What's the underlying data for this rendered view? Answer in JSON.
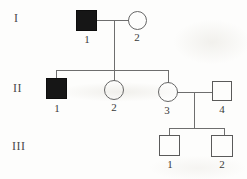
{
  "diagram": {
    "type": "pedigree-chart",
    "generations": [
      {
        "label": "I"
      },
      {
        "label": "II"
      },
      {
        "label": "III"
      }
    ],
    "individuals": [
      {
        "id": "I-1",
        "label": "1",
        "sex": "male",
        "affected": true
      },
      {
        "id": "I-2",
        "label": "2",
        "sex": "female",
        "affected": false
      },
      {
        "id": "II-1",
        "label": "1",
        "sex": "male",
        "affected": true
      },
      {
        "id": "II-2",
        "label": "2",
        "sex": "female",
        "affected": false
      },
      {
        "id": "II-3",
        "label": "3",
        "sex": "female",
        "affected": false
      },
      {
        "id": "II-4",
        "label": "4",
        "sex": "male",
        "affected": false
      },
      {
        "id": "III-1",
        "label": "1",
        "sex": "male",
        "affected": false
      },
      {
        "id": "III-2",
        "label": "2",
        "sex": "male",
        "affected": false
      }
    ],
    "relationships": {
      "couples": [
        "I-1 x I-2",
        "II-3 x II-4"
      ],
      "children_of_I": [
        "II-1",
        "II-2",
        "II-3"
      ],
      "children_of_II3_II4": [
        "III-1",
        "III-2"
      ]
    },
    "colors": {
      "line": "#6e6e6e",
      "shape_stroke": "#5a5a5a",
      "affected_fill": "#161616",
      "label_text": "#3a3a3a",
      "background": "#fdfdfc"
    }
  }
}
